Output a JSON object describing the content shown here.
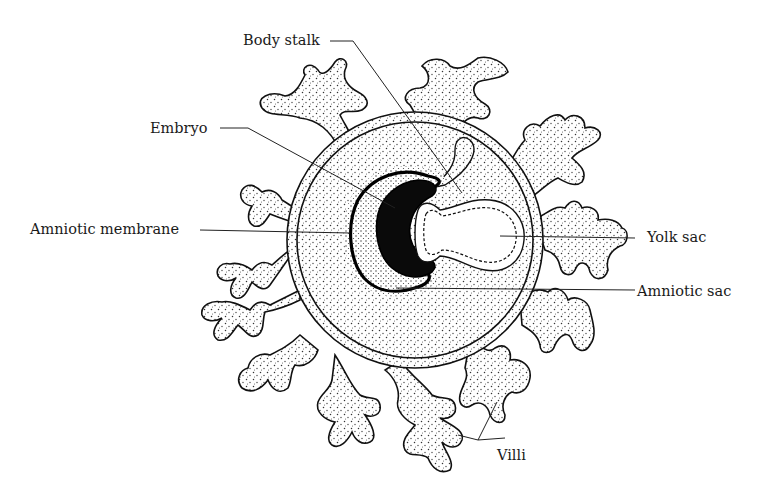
{
  "diagram": {
    "labels": {
      "body_stalk": "Body stalk",
      "embryo": "Embryo",
      "amniotic_membrane": "Amniotic membrane",
      "yolk_sac": "Yolk sac",
      "amniotic_sac": "Amniotic sac",
      "villi": "Villi"
    },
    "colors": {
      "ink": "#111111",
      "background": "#ffffff",
      "embryo_fill": "#0a0a0a",
      "stipple": "#333333"
    }
  }
}
